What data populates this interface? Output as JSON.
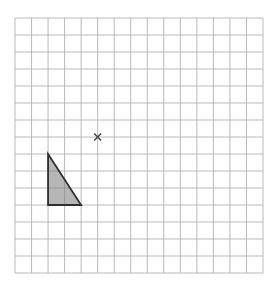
{
  "page": {
    "width_px": 279,
    "height_px": 292,
    "background": "#ffffff"
  },
  "diagram": {
    "type": "geometry-grid",
    "grid": {
      "columns": 15,
      "rows": 15,
      "x_px": 15,
      "y_px": 18,
      "width_px": 248,
      "height_px": 255,
      "line_color": "#b2b2b2",
      "line_width_px": 0.9,
      "background": "#ffffff"
    },
    "shapes": [
      {
        "name": "shaded-triangle",
        "type": "polygon",
        "vertices_grid_units": [
          [
            2,
            8
          ],
          [
            2,
            11
          ],
          [
            4,
            11
          ]
        ],
        "right_angle_at_grid": [
          2,
          11
        ],
        "legs_grid_units": {
          "vertical": 3,
          "horizontal": 2
        },
        "fill_color": "rgba(122,122,122,0.55)",
        "border_color": "#2f2f2f",
        "border_width_px": 1.8
      }
    ],
    "markers": [
      {
        "name": "x-marker",
        "glyph": "x",
        "position_grid_units": [
          5,
          7
        ],
        "color": "#4d4d4d",
        "size_px": 6,
        "stroke_width_px": 1.7
      }
    ]
  }
}
